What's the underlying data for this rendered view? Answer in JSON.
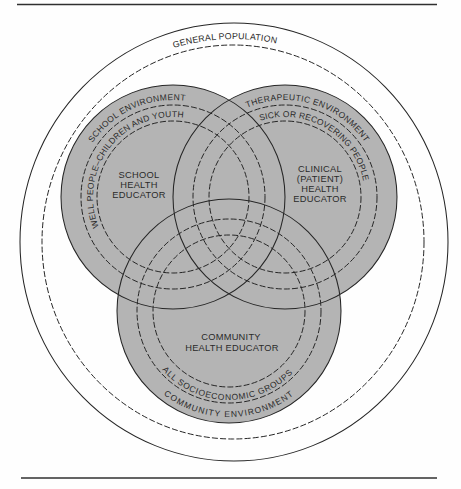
{
  "diagram": {
    "outer": {
      "label": "GENERAL POPULATION"
    },
    "circles": {
      "school": {
        "environment": "SCHOOL ENVIRONMENT",
        "population": "WELL PEOPLE–CHILDREN AND YOUTH",
        "role": [
          "SCHOOL",
          "HEALTH",
          "EDUCATOR"
        ]
      },
      "clinical": {
        "environment": "THERAPEUTIC ENVIRONMENT",
        "population": "SICK OR RECOVERING PEOPLE",
        "role": [
          "CLINICAL",
          "(PATIENT)",
          "HEALTH",
          "EDUCATOR"
        ]
      },
      "community": {
        "environment": "COMMUNITY ENVIRONMENT",
        "population": "ALL SOCIOECONOMIC GROUPS",
        "role": [
          "COMMUNITY",
          "HEALTH EDUCATOR"
        ]
      }
    }
  },
  "colors": {
    "circle_fill": "#b4b4b4",
    "line": "#262626",
    "background": "#fefefe"
  }
}
